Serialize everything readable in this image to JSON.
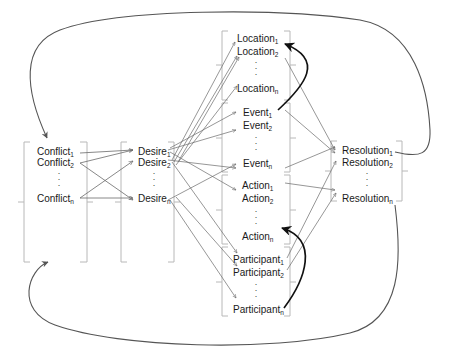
{
  "diagram": {
    "type": "story-structure-graph",
    "groups": [
      {
        "id": "conflict",
        "items": [
          {
            "base": "Conflict",
            "sub": "1"
          },
          {
            "base": "Conflict",
            "sub": "2"
          },
          {
            "base": "Conflict",
            "sub": "n"
          }
        ]
      },
      {
        "id": "desire",
        "items": [
          {
            "base": "Desire",
            "sub": "1"
          },
          {
            "base": "Desire",
            "sub": "2"
          },
          {
            "base": "Desire",
            "sub": "n"
          }
        ]
      },
      {
        "id": "location",
        "items": [
          {
            "base": "Location",
            "sub": "1"
          },
          {
            "base": "Location",
            "sub": "2"
          },
          {
            "base": "Location",
            "sub": "n"
          }
        ]
      },
      {
        "id": "event",
        "items": [
          {
            "base": "Event",
            "sub": "1"
          },
          {
            "base": "Event",
            "sub": "2"
          },
          {
            "base": "Event",
            "sub": "n"
          }
        ]
      },
      {
        "id": "action",
        "items": [
          {
            "base": "Action",
            "sub": "1"
          },
          {
            "base": "Action",
            "sub": "2"
          },
          {
            "base": "Action",
            "sub": "n"
          }
        ]
      },
      {
        "id": "participant",
        "items": [
          {
            "base": "Participant",
            "sub": "1"
          },
          {
            "base": "Participant",
            "sub": "2"
          },
          {
            "base": "Participant",
            "sub": "n"
          }
        ]
      },
      {
        "id": "resolution",
        "items": [
          {
            "base": "Resolution",
            "sub": "1"
          },
          {
            "base": "Resolution",
            "sub": "2"
          },
          {
            "base": "Resolution",
            "sub": "n"
          }
        ]
      }
    ],
    "ellipsis": ". . .",
    "colors": {
      "text": "#1a1a1a",
      "thin_arrow": "#6a6a6a",
      "bracket": "#b8b8b8",
      "loop": "#555555",
      "bold_arrow": "#111111"
    }
  }
}
